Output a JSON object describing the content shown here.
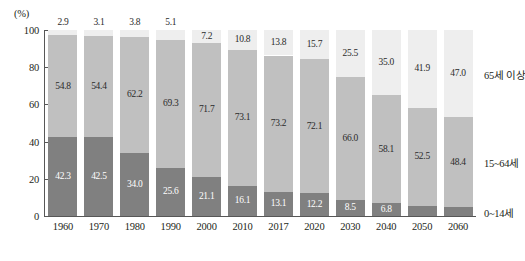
{
  "chart_data": {
    "type": "bar",
    "stacked": true,
    "title": "",
    "subtitle": "",
    "xlabel": "",
    "ylabel": "",
    "unit_label": "(%)",
    "ylim": [
      0,
      100
    ],
    "ytick_labels": [
      "0",
      "20",
      "40",
      "60",
      "80",
      "100"
    ],
    "ytick_values": [
      0,
      20,
      40,
      60,
      80,
      100
    ],
    "grid": false,
    "legend_position": "right",
    "categories": [
      "1960",
      "1970",
      "1980",
      "1990",
      "2000",
      "2010",
      "2017",
      "2020",
      "2030",
      "2040",
      "2050",
      "2060"
    ],
    "series": [
      {
        "name": "0~14세",
        "color": "#808080",
        "values": [
          42.3,
          42.5,
          34.0,
          25.6,
          21.1,
          16.1,
          13.1,
          12.2,
          8.5,
          6.8,
          5.6,
          4.6
        ],
        "labels": [
          "42.3",
          "42.5",
          "34.0",
          "25.6",
          "21.1",
          "16.1",
          "13.1",
          "12.2",
          "8.5",
          "6.8",
          "5.6",
          "4.6"
        ]
      },
      {
        "name": "15~64세",
        "color": "#c0c0c0",
        "values": [
          54.8,
          54.4,
          62.2,
          69.3,
          71.7,
          73.1,
          73.2,
          72.1,
          66.0,
          58.1,
          52.5,
          48.4
        ],
        "labels": [
          "54.8",
          "54.4",
          "62.2",
          "69.3",
          "71.7",
          "73.1",
          "73.2",
          "72.1",
          "66.0",
          "58.1",
          "52.5",
          "48.4"
        ]
      },
      {
        "name": "65세 이상",
        "color": "#eeeeee",
        "values": [
          2.9,
          3.1,
          3.8,
          5.1,
          7.2,
          10.8,
          13.8,
          15.7,
          25.5,
          35.0,
          41.9,
          47.0
        ],
        "labels": [
          "2.9",
          "3.1",
          "3.8",
          "5.1",
          "7.2",
          "10.8",
          "13.8",
          "15.7",
          "25.5",
          "35.0",
          "41.9",
          "47.0"
        ]
      }
    ],
    "legend": [
      {
        "label": "65세 이상",
        "color": "#eeeeee"
      },
      {
        "label": "15~64세",
        "color": "#c0c0c0"
      },
      {
        "label": "0~14세",
        "color": "#808080"
      }
    ]
  }
}
